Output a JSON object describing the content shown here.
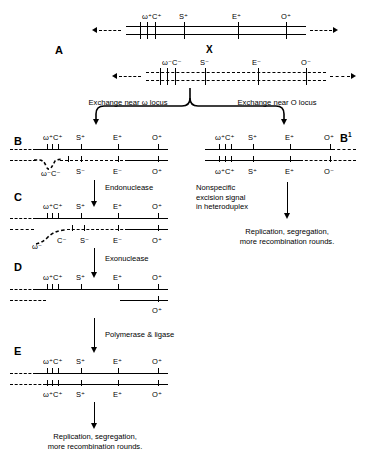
{
  "figure": {
    "type": "molecular-genetics-diagram"
  },
  "panels": {
    "A": {
      "letter": "A",
      "cross_label": "X",
      "top_strand": {
        "style": "solid-duplex",
        "markers": [
          "ω⁺C⁺",
          "S⁺",
          "E⁺",
          "O⁺"
        ]
      },
      "bottom_strand": {
        "style": "dashed-duplex",
        "markers": [
          "ω⁻C⁻",
          "S⁻",
          "E⁻",
          "O⁻"
        ]
      }
    },
    "B": {
      "letter": "B",
      "top_markers": [
        "ω⁺C⁺",
        "S⁺",
        "E⁺",
        "O⁺"
      ],
      "bottom_markers": [
        "ω⁻C⁻",
        "S⁻",
        "E⁻",
        "O⁺"
      ]
    },
    "B1": {
      "letter": "B",
      "letter_sup": "1",
      "top_markers": [
        "ω⁺C⁺",
        "S⁺",
        "E⁺",
        "O⁺"
      ],
      "bottom_markers": [
        "ω⁺C⁺",
        "S⁺",
        "E⁺",
        "O⁻"
      ]
    },
    "C": {
      "letter": "C",
      "top_markers": [
        "ω⁺C⁺",
        "S⁺",
        "E⁺",
        "O⁺"
      ],
      "bottom_markers": [
        "ω⁻",
        "C⁻",
        "S⁻",
        "E⁻",
        "O⁺"
      ]
    },
    "D": {
      "letter": "D",
      "top_markers": [
        "ω⁺C⁺",
        "S⁺",
        "E⁺",
        "O⁺"
      ],
      "bottom_markers": [
        "O⁺"
      ]
    },
    "E": {
      "letter": "E",
      "top_markers": [
        "ω⁺C⁺",
        "S⁺",
        "E⁺",
        "O⁺"
      ],
      "bottom_markers": [
        "ω⁺C⁺",
        "S⁺",
        "E⁺",
        "O⁺"
      ]
    }
  },
  "annotations": {
    "exchange_omega": "Exchange near ω locus",
    "exchange_o": "Exchange near O locus",
    "endonuclease": "Endonuclease",
    "exonuclease": "Exonuclease",
    "polymerase_ligase": "Polymerase & ligase",
    "nonspecific_line1": "Nonspecific",
    "nonspecific_line2": "excision signal",
    "nonspecific_line3": "in heteroduplex",
    "outcome_right_line1": "Replication, segregation,",
    "outcome_right_line2": "more recombination rounds.",
    "outcome_bottom_line1": "Replication, segregation,",
    "outcome_bottom_line2": "more recombination rounds."
  },
  "colors": {
    "ink": "#000000",
    "background": "#ffffff"
  }
}
